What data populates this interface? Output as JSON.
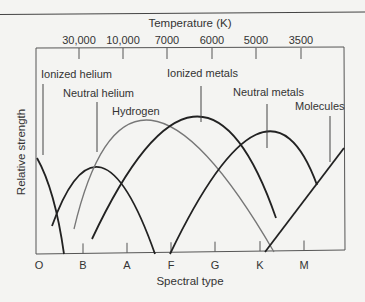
{
  "chart_data": {
    "type": "line",
    "title": "",
    "top_axis_label": "Temperature (K)",
    "top_ticks": [
      {
        "label": "30,000",
        "x": 79
      },
      {
        "label": "10,000",
        "x": 123
      },
      {
        "label": "7000",
        "x": 167
      },
      {
        "label": "6000",
        "x": 212
      },
      {
        "label": "5000",
        "x": 256
      },
      {
        "label": "3500",
        "x": 301
      }
    ],
    "xlabel": "Spectral type",
    "ylabel": "Relative strength",
    "bottom_ticks": [
      {
        "label": "O",
        "x": 39
      },
      {
        "label": "B",
        "x": 83
      },
      {
        "label": "A",
        "x": 127
      },
      {
        "label": "F",
        "x": 171
      },
      {
        "label": "G",
        "x": 215
      },
      {
        "label": "K",
        "x": 260
      },
      {
        "label": "M",
        "x": 304
      }
    ],
    "series": [
      {
        "name": "Ionized helium",
        "color": "#222222",
        "path": "M37,158 Q55,190 64,254",
        "label_x": 41,
        "label_y": 78,
        "leader": [
          43,
          84,
          43,
          155
        ]
      },
      {
        "name": "Neutral helium",
        "color": "#222222",
        "path": "M52,226 Q99,95 155,254",
        "label_x": 63,
        "label_y": 97,
        "leader": [
          97,
          102,
          97,
          152
        ]
      },
      {
        "name": "Hydrogen",
        "color": "#777777",
        "path": "M74,229 Q128,0 274,252",
        "label_x": 112,
        "label_y": 115,
        "leader": null
      },
      {
        "name": "Ionized metals",
        "color": "#222222",
        "path": "M92,239 Q202,5 276,218",
        "label_x": 167,
        "label_y": 77,
        "leader": [
          201,
          86,
          201,
          122
        ]
      },
      {
        "name": "Neutral metals",
        "color": "#222222",
        "path": "M170,254 Q268,50 317,185",
        "label_x": 233,
        "label_y": 96,
        "leader": [
          267,
          104,
          267,
          148
        ]
      },
      {
        "name": "Molecules",
        "color": "#222222",
        "path": "M265,252 L344,148",
        "label_x": 295,
        "label_y": 110,
        "leader": [
          330,
          116,
          330,
          162
        ]
      }
    ],
    "grid": false,
    "legend": "inline labels"
  },
  "labels": {
    "top_axis_title": "Temperature (K)",
    "x_axis_title": "Spectral type",
    "y_axis_title": "Relative strength"
  }
}
